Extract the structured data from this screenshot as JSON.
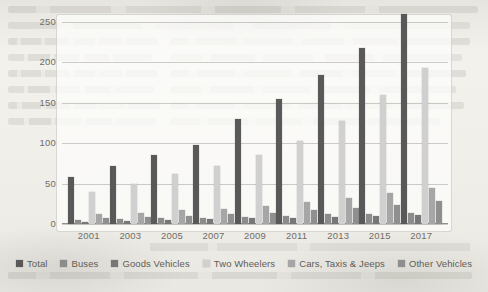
{
  "chart_data": {
    "type": "bar",
    "title": "",
    "xlabel": "",
    "ylabel": "",
    "ylim": [
      0,
      250
    ],
    "yticks": [
      0,
      50,
      100,
      150,
      200,
      250
    ],
    "grid": true,
    "legend_position": "bottom",
    "categories": [
      "2001",
      "2003",
      "2005",
      "2007",
      "2009",
      "2011",
      "2013",
      "2015",
      "2017"
    ],
    "series": [
      {
        "name": "Total",
        "color": "#595959",
        "values": [
          58,
          72,
          85,
          98,
          130,
          155,
          185,
          218,
          260
        ]
      },
      {
        "name": "Buses",
        "color": "#8c8c8c",
        "values": [
          5,
          6,
          7,
          8,
          9,
          10,
          12,
          13,
          14
        ]
      },
      {
        "name": "Goods Vehicles",
        "color": "#777777",
        "values": [
          3,
          4,
          5,
          6,
          7,
          8,
          9,
          10,
          11
        ]
      },
      {
        "name": "Two Wheelers",
        "color": "#d0d0d0",
        "values": [
          40,
          49,
          62,
          72,
          85,
          103,
          127,
          160,
          193
        ]
      },
      {
        "name": "Cars, Taxis & Jeeps",
        "color": "#a6a6a6",
        "values": [
          12,
          14,
          17,
          19,
          22,
          27,
          32,
          38,
          45
        ]
      },
      {
        "name": "Other Vehicles",
        "color": "#8f8f8f",
        "values": [
          8,
          9,
          10,
          12,
          14,
          17,
          20,
          24,
          28
        ]
      }
    ]
  },
  "legend": {
    "items": [
      {
        "label": "Total"
      },
      {
        "label": "Buses"
      },
      {
        "label": "Goods Vehicles"
      },
      {
        "label": "Two Wheelers"
      },
      {
        "label": "Cars, Taxis & Jeeps"
      },
      {
        "label": "Other Vehicles"
      }
    ]
  }
}
